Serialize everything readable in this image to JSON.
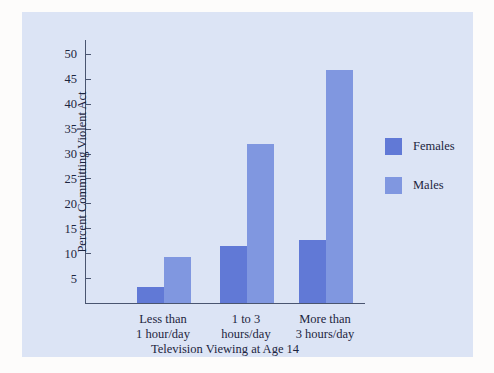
{
  "chart_data": {
    "type": "bar",
    "title": "",
    "xlabel": "Television Viewing at Age 14",
    "ylabel": "Percent Committing Violent Act",
    "categories": [
      "Less than\n1 hour/day",
      "1 to 3\nhours/day",
      "More than\n3 hours/day"
    ],
    "category_lines": [
      [
        "Less than",
        "1 hour/day"
      ],
      [
        "1 to 3",
        "hours/day"
      ],
      [
        "More than",
        "3 hours/day"
      ]
    ],
    "series": [
      {
        "name": "Females",
        "color": "#6179d6",
        "values": [
          3.2,
          11.5,
          12.7
        ]
      },
      {
        "name": "Males",
        "color": "#8097e0",
        "values": [
          9.2,
          32.0,
          46.7
        ]
      }
    ],
    "ylim": [
      0,
      53
    ],
    "yticks": [
      5,
      10,
      15,
      20,
      25,
      30,
      35,
      40,
      45,
      50
    ],
    "ytick_labels": [
      "5",
      "10",
      "15",
      "20",
      "25",
      "30",
      "35",
      "40",
      "45",
      "50"
    ],
    "grid": false,
    "legend_position": "right-outside"
  },
  "legend": {
    "entries": [
      {
        "label": "Females"
      },
      {
        "label": "Males"
      }
    ]
  },
  "colors": {
    "females": "#6179d6",
    "males": "#8097e0",
    "panel_background": "#dce4f5",
    "page_background": "#fdfcfb",
    "axis": "#4a5570",
    "text": "#1d2540"
  }
}
